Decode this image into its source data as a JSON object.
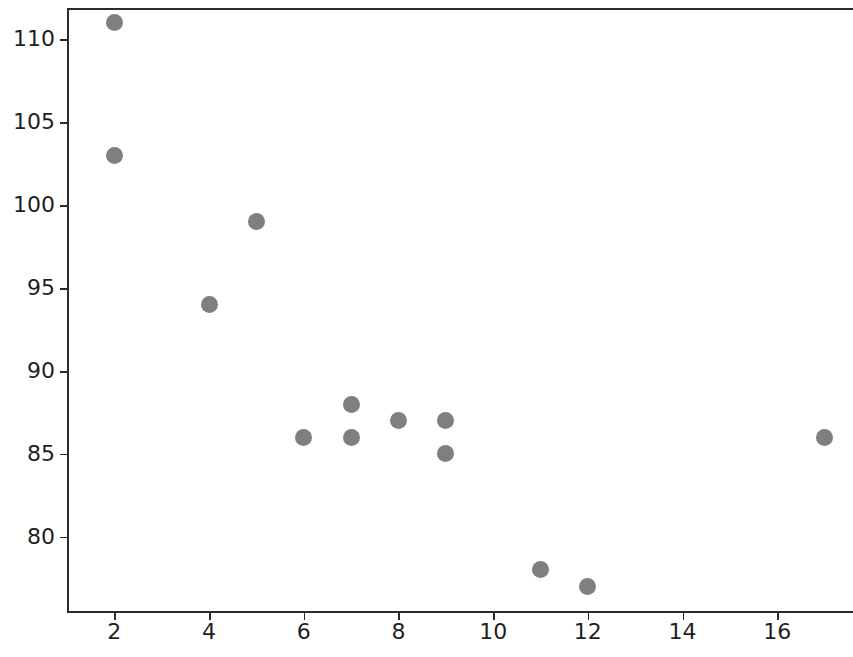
{
  "chart_data": {
    "type": "scatter",
    "title": "",
    "subtitle": "",
    "xlabel": "",
    "ylabel": "",
    "xlim": [
      1.0,
      17.6
    ],
    "ylim": [
      75.4,
      111.9
    ],
    "xticks": [
      2,
      4,
      6,
      8,
      10,
      12,
      14,
      16
    ],
    "yticks": [
      80,
      85,
      90,
      95,
      100,
      105,
      110
    ],
    "xtick_labels": [
      "2",
      "4",
      "6",
      "8",
      "10",
      "12",
      "14",
      "16"
    ],
    "ytick_labels": [
      "80",
      "85",
      "90",
      "95",
      "100",
      "105",
      "110"
    ],
    "grid": false,
    "legend": null,
    "legend_position": "none",
    "annotations": [],
    "marker": {
      "shape": "circle",
      "color": "#7f7f7f",
      "size_px": 17
    },
    "spines": {
      "left": true,
      "top": true,
      "bottom": true,
      "right": false
    },
    "series": [
      {
        "name": "points",
        "color": "#7f7f7f",
        "points": [
          {
            "x": 2,
            "y": 111
          },
          {
            "x": 2,
            "y": 103
          },
          {
            "x": 4,
            "y": 94
          },
          {
            "x": 5,
            "y": 99
          },
          {
            "x": 6,
            "y": 86
          },
          {
            "x": 7,
            "y": 88
          },
          {
            "x": 7,
            "y": 86
          },
          {
            "x": 8,
            "y": 87
          },
          {
            "x": 9,
            "y": 87
          },
          {
            "x": 9,
            "y": 85
          },
          {
            "x": 11,
            "y": 78
          },
          {
            "x": 12,
            "y": 77
          },
          {
            "x": 17,
            "y": 86
          }
        ]
      }
    ]
  },
  "figure": {
    "background_color": "#ffffff",
    "axis_color": "#2b2b2b",
    "tick_label_color": "#1f1f1f"
  }
}
